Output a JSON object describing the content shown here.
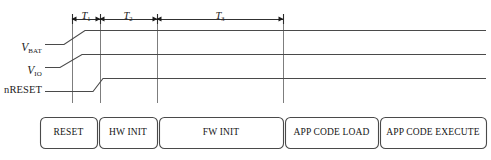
{
  "figure": {
    "type": "timing-diagram",
    "background": "#ffffff",
    "line_color": "#4a4a4a",
    "text_color": "#1a1a1a",
    "width": 491,
    "height": 160
  },
  "signals": [
    {
      "id": "vbat",
      "name": "V_BAT",
      "base": "V",
      "subscript": "BAT",
      "low_y": 44,
      "high_y": 30,
      "rise_start_x": 64,
      "rise_end_x": 85,
      "start_x": 45,
      "end_x": 486
    },
    {
      "id": "vio",
      "name": "V_IO",
      "base": "V",
      "subscript": "IO",
      "low_y": 67,
      "high_y": 54,
      "rise_start_x": 60,
      "rise_end_x": 82,
      "start_x": 45,
      "end_x": 486
    },
    {
      "id": "nreset",
      "name": "nRESET",
      "base": "nRESET",
      "subscript": "",
      "low_y": 91,
      "high_y": 78,
      "rise_start_x": 93,
      "rise_end_x": 103,
      "start_x": 45,
      "end_x": 486
    }
  ],
  "gridlines": [
    {
      "x": 72,
      "top": 14,
      "bottom": 103
    },
    {
      "x": 100,
      "top": 14,
      "bottom": 103
    },
    {
      "x": 157,
      "top": 14,
      "bottom": 103
    },
    {
      "x": 283,
      "top": 14,
      "bottom": 103
    }
  ],
  "intervals": [
    {
      "id": "t1",
      "base": "T",
      "subscript": "1",
      "from_x": 72,
      "to_x": 100,
      "label_x": 86,
      "label_y": 6
    },
    {
      "id": "t2",
      "base": "T",
      "subscript": "2",
      "from_x": 100,
      "to_x": 157,
      "label_x": 128,
      "label_y": 6
    },
    {
      "id": "t3",
      "base": "T",
      "subscript": "3",
      "from_x": 157,
      "to_x": 283,
      "label_x": 220,
      "label_y": 6
    }
  ],
  "arrow_row_y": 19,
  "tick_top_y": 14,
  "tick_bottom_y": 24,
  "phase_bar": {
    "left": 40,
    "right": 486,
    "top": 117,
    "bottom": 148,
    "corner_radius": 5,
    "boxes": [
      {
        "id": "reset",
        "label": "RESET",
        "x1": 40,
        "x2": 97
      },
      {
        "id": "hw-init",
        "label": "HW INIT",
        "x1": 99,
        "x2": 157
      },
      {
        "id": "fw-init",
        "label": "FW INIT",
        "x1": 159,
        "x2": 283
      },
      {
        "id": "app-code-load",
        "label": "APP CODE LOAD",
        "x1": 285,
        "x2": 378
      },
      {
        "id": "app-code-execute",
        "label": "APP CODE EXECUTE",
        "x1": 380,
        "x2": 486
      }
    ]
  }
}
